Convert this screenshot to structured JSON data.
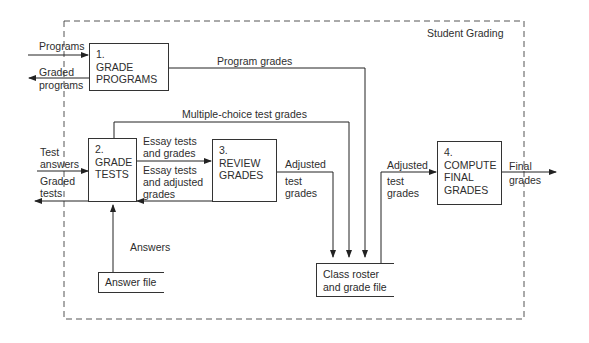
{
  "diagram": {
    "type": "data-flow",
    "boundary_label": "Student Grading",
    "processes": [
      {
        "id": 1,
        "number": "1.",
        "line1": "GRADE",
        "line2": "PROGRAMS",
        "line3": ""
      },
      {
        "id": 2,
        "number": "2.",
        "line1": "GRADE",
        "line2": "TESTS",
        "line3": ""
      },
      {
        "id": 3,
        "number": "3.",
        "line1": "REVIEW",
        "line2": "GRADES",
        "line3": ""
      },
      {
        "id": 4,
        "number": "4.",
        "line1": "COMPUTE",
        "line2": "FINAL",
        "line3": "GRADES"
      }
    ],
    "stores": [
      {
        "id": "answer_file",
        "line1": "Answer file",
        "line2": ""
      },
      {
        "id": "class_roster",
        "line1": "Class roster",
        "line2": "and grade file"
      }
    ],
    "flows": {
      "programs": "Programs",
      "graded_programs_1": "Graded",
      "graded_programs_2": "programs",
      "program_grades": "Program grades",
      "multiple_choice": "Multiple-choice test grades",
      "test_answers_1": "Test",
      "test_answers_2": "answers",
      "graded_tests_1": "Graded",
      "graded_tests_2": "tests",
      "essay_grades_1": "Essay tests",
      "essay_grades_2": "and grades",
      "essay_adjusted_1": "Essay tests",
      "essay_adjusted_2": "and adjusted",
      "essay_adjusted_3": "grades",
      "adjusted_a_1": "Adjusted",
      "adjusted_a_2": "test",
      "adjusted_a_3": "grades",
      "answers": "Answers",
      "adjusted_b_1": "Adjusted",
      "adjusted_b_2": "test",
      "adjusted_b_3": "grades",
      "final_1": "Final",
      "final_2": "grades"
    }
  }
}
